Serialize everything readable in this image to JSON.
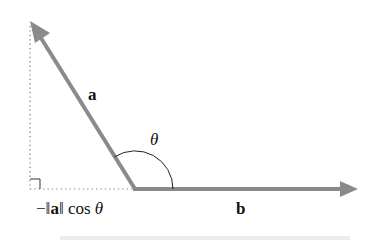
{
  "diagram": {
    "colors": {
      "vector": "#8a8a8a",
      "guide": "#777777",
      "arc": "#222222",
      "text": "#111111",
      "bottom_shadow": "#e6e6e6"
    },
    "vertex": {
      "x": 135,
      "y": 189
    },
    "vectors": [
      {
        "name": "a",
        "label": "a",
        "from": [
          135,
          189
        ],
        "to": [
          32,
          24
        ]
      },
      {
        "name": "b",
        "label": "b",
        "from": [
          135,
          189
        ],
        "to": [
          358,
          189
        ]
      }
    ],
    "angle": {
      "label": "θ",
      "radius": 38
    },
    "projection": {
      "label_parts": [
        "−‖",
        "a",
        "‖ cos ",
        "θ"
      ],
      "dotted_vertical": {
        "x": 30,
        "y1": 26,
        "y2": 189
      },
      "dotted_horizontal": {
        "y": 189,
        "x1": 30,
        "x2": 135
      },
      "right_angle_marker_size": 10
    }
  }
}
